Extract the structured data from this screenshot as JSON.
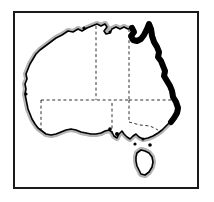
{
  "figure": {
    "kind": "line-art-map",
    "width": 214,
    "height": 202,
    "background_color": "#ffffff"
  },
  "frame": {
    "name": "border-frame",
    "x": 14,
    "y": 12,
    "width": 184,
    "height": 176,
    "stroke_color": "#1a1a1a",
    "stroke_width": 2,
    "fill_color": "#ffffff"
  },
  "style": {
    "coast_color": "#000000",
    "coast_width": 1.6,
    "halo_color": "#b4b4b4",
    "halo_width": 1.0,
    "halo_offset": 2.2,
    "emphasis_color": "#000000",
    "emphasis_width": 6.0,
    "state_border_color": "#1a1a1a",
    "state_border_width": 0.9,
    "state_border_dash": "3 2.6",
    "island_color": "#000000",
    "interior_fill": "#ffffff"
  },
  "map": {
    "mainland": {
      "name": "australia-mainland",
      "outline_path": "M 62,35 L 68,31 L 73,32 L 78,29 L 82,31 L 87,28 L 92,26 L 97,24 L 101,26 L 105,24 L 107,27 L 104,31 L 106,34 L 110,33 L 112,29 L 116,27 L 120,29 L 124,27 L 128,29 L 132,28 L 134,32 L 131,36 L 133,40 L 137,41 L 141,39 L 144,35 L 147,29 L 149,24 L 151,29 L 152,36 L 154,42 L 157,47 L 159,52 L 158,57 L 161,61 L 163,66 L 165,71 L 164,76 L 167,81 L 170,86 L 172,91 L 173,97 L 176,102 L 178,108 L 177,113 L 174,118 L 170,122 L 166,126 L 162,130 L 158,133 L 153,136 L 148,138 L 143,139 L 139,137 L 136,134 L 133,136 L 130,139 L 127,137 L 124,134 L 122,131 L 119,134 L 117,138 L 114,136 L 112,132 L 109,130 L 105,131 L 101,133 L 96,134 L 91,134 L 86,133 L 81,132 L 76,130 L 71,129 L 66,130 L 61,132 L 56,134 L 51,135 L 46,134 L 42,131 L 38,128 L 35,124 L 32,119 L 30,114 L 28,109 L 27,104 L 26,99 L 25,94 L 26,89 L 25,84 L 27,79 L 26,74 L 28,69 L 30,64 L 33,59 L 36,54 L 40,50 L 44,47 L 48,44 L 52,41 L 56,38 L 62,35 Z"
    },
    "tasmania": {
      "name": "tasmania-island",
      "outline_path": "M 137,153 L 141,150 L 145,151 L 149,153 L 152,157 L 153,162 L 152,167 L 149,172 L 145,175 L 141,174 L 139,170 L 137,166 L 136,161 L 136,157 L 137,153 Z"
    },
    "east_coast_emphasis": {
      "name": "east-coast-emphasis-line",
      "label": "thick black east coast band",
      "path": "M 132,28 L 134,32 L 131,36 L 133,40 L 137,41 L 141,39 L 144,35 L 147,29 L 149,24 L 151,29 L 152,36 L 154,42 L 157,47 L 159,52 L 158,57 L 161,61 L 163,66 L 165,71 L 164,76 L 167,81 L 170,86 L 172,91 L 173,97 L 176,102 L 178,108 L 177,113 L 174,118 L 171,122"
    },
    "state_borders": [
      {
        "name": "state-border-wa-nt",
        "path": "M 96,26 L 96,100"
      },
      {
        "name": "state-border-nt-qld",
        "path": "M 129,29 L 129,100"
      },
      {
        "name": "state-border-sa-north",
        "path": "M 41,100 L 129,100"
      },
      {
        "name": "state-border-wa-sa",
        "path": "M 41,100 L 41,133"
      },
      {
        "name": "state-border-sa-nsw",
        "path": "M 129,100 L 129,122"
      },
      {
        "name": "state-border-qld-nsw",
        "path": "M 129,100 L 172,100"
      },
      {
        "name": "state-border-vic-nsw",
        "path": "M 129,122 L 140,125 L 150,126 L 158,130"
      },
      {
        "name": "state-border-sa-vic",
        "path": "M 112,103 L 112,134"
      }
    ],
    "islands": [
      {
        "name": "island-dot-melville",
        "cx": 84,
        "cy": 28,
        "r": 1.6
      },
      {
        "name": "island-dot-groote",
        "cx": 110,
        "cy": 32,
        "r": 1.5
      },
      {
        "name": "island-dot-kangaroo",
        "cx": 117,
        "cy": 134,
        "r": 2.0
      },
      {
        "name": "island-dot-eyre",
        "cx": 110,
        "cy": 129,
        "r": 1.8
      },
      {
        "name": "island-dot-flinders",
        "cx": 150,
        "cy": 145,
        "r": 1.8
      },
      {
        "name": "island-dot-king",
        "cx": 135,
        "cy": 144,
        "r": 1.6
      },
      {
        "name": "island-dot-cape-leeuwin",
        "cx": 26,
        "cy": 94,
        "r": 1.6
      },
      {
        "name": "island-dot-wilsons",
        "cx": 143,
        "cy": 139,
        "r": 1.5
      }
    ]
  }
}
